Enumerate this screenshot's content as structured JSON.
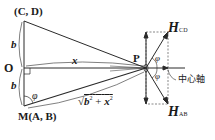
{
  "diagram": {
    "type": "geometry-magnetic-field",
    "labels": {
      "top_point": "(C, D)",
      "origin": "O",
      "bottom_point": "M(A, B)",
      "field_point": "P",
      "b_upper": "b",
      "b_lower": "b",
      "x": "x",
      "phi_angle": "φ",
      "phi_upper": "φ",
      "phi_lower": "φ",
      "hypotenuse": "√b² + x²",
      "hypotenuse_radicand_b": "b",
      "hypotenuse_radicand_x": "x",
      "hypotenuse_exp": "2",
      "plus": "+",
      "sqrt": "√",
      "h_cd_main": "H",
      "h_cd_sub": "CD",
      "h_ab_main": "H",
      "h_ab_sub": "AB",
      "axis": "中心軸"
    },
    "colors": {
      "line": "#2a2a2a",
      "dashed": "#555555",
      "text": "#1a1a1a"
    }
  }
}
